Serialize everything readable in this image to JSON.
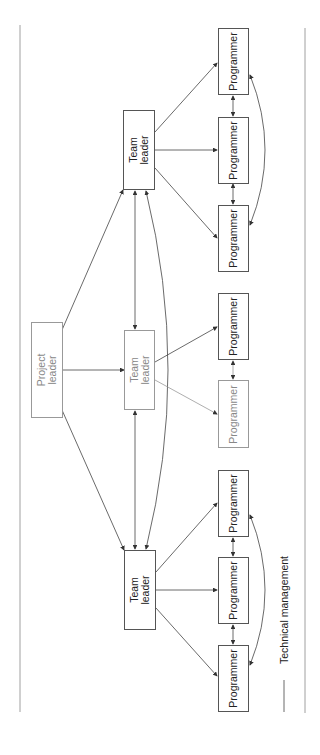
{
  "diagram": {
    "type": "organization-chart",
    "orientation": "rotated-90-ccw",
    "nodes": {
      "project_leader": {
        "label": "Project\nleader"
      },
      "team_leader_1": {
        "label": "Team\nleader"
      },
      "team_leader_2": {
        "label": "Team\nleader"
      },
      "team_leader_3": {
        "label": "Team\nleader"
      },
      "programmers": [
        {
          "label": "Programmer"
        },
        {
          "label": "Programmer"
        },
        {
          "label": "Programmer"
        },
        {
          "label": "Programmer"
        },
        {
          "label": "Programmer"
        },
        {
          "label": "Programmer"
        },
        {
          "label": "Programmer"
        },
        {
          "label": "Programmer"
        }
      ]
    },
    "legend": {
      "label": "Technical management"
    }
  }
}
